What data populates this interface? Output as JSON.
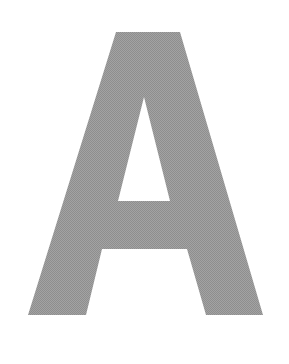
{
  "glyph": {
    "character": "A",
    "fill_color": "#9a9a9a",
    "background_color": "#ffffff"
  }
}
